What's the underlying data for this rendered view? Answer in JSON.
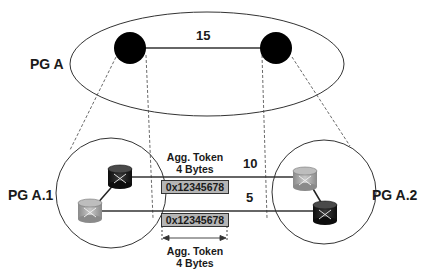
{
  "diagram": {
    "top_group": {
      "label": "PG A",
      "link_metric": "15",
      "nodes": [
        "logical-node-left",
        "logical-node-right"
      ]
    },
    "left_group": {
      "label": "PG A.1",
      "routers": [
        "router-dark",
        "router-gray"
      ]
    },
    "right_group": {
      "label": "PG A.2",
      "routers": [
        "router-gray",
        "router-dark"
      ]
    },
    "links": [
      {
        "metric": "10",
        "token": "0x12345678"
      },
      {
        "metric": "5",
        "token": "0x12345678"
      }
    ],
    "agg_token_top": {
      "line1": "Agg. Token",
      "line2": "4 Bytes"
    },
    "agg_token_bottom": {
      "line1": "Agg. Token",
      "line2": "4 Bytes"
    },
    "colors": {
      "node": "#000000",
      "token_bg": "#b5b5b5",
      "router_dark": "#1c1c1c",
      "router_gray": "#a9a9a9",
      "line": "#333333"
    }
  }
}
